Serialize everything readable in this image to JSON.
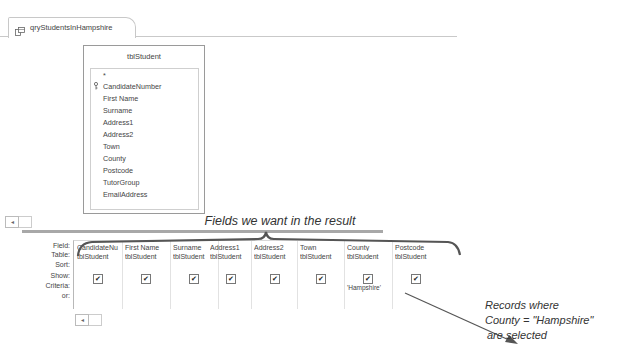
{
  "tab": {
    "label": "qryStudentsInHampshire",
    "icon": "query-icon"
  },
  "table": {
    "name": "tblStudent",
    "fields": [
      "*",
      "CandidateNumber",
      "First Name",
      "Surname",
      "Address1",
      "Address2",
      "Town",
      "County",
      "Postcode",
      "TutorGroup",
      "EmailAddress"
    ],
    "primary_key": "CandidateNumber"
  },
  "grid": {
    "row_labels": {
      "field": "Field:",
      "table": "Table:",
      "sort": "Sort:",
      "show": "Show:",
      "criteria": "Criteria:",
      "or": "or:"
    },
    "columns": [
      {
        "field": "CandidateNumber",
        "display": "CandidateNu",
        "table": "tblStudent",
        "show": true,
        "criteria": ""
      },
      {
        "field": "First Name",
        "display": "First Name",
        "table": "tblStudent",
        "show": true,
        "criteria": ""
      },
      {
        "field": "Surname",
        "display": "Surname",
        "table": "tblStudent",
        "show": true,
        "criteria": ""
      },
      {
        "field": "Address1",
        "display": "Address1",
        "table": "tblStudent",
        "show": true,
        "criteria": ""
      },
      {
        "field": "Address2",
        "display": "Address2",
        "table": "tblStudent",
        "show": true,
        "criteria": ""
      },
      {
        "field": "Town",
        "display": "Town",
        "table": "tblStudent",
        "show": true,
        "criteria": ""
      },
      {
        "field": "County",
        "display": "County",
        "table": "tblStudent",
        "show": true,
        "criteria": "'Hampshire'"
      },
      {
        "field": "Postcode",
        "display": "Postcode",
        "table": "tblStudent",
        "show": true,
        "criteria": ""
      }
    ],
    "checkmark": "✔"
  },
  "annotations": {
    "fields_note": "Fields we want in the result",
    "callout_line1": "Records where",
    "callout_line2": "County = \"Hampshire\"",
    "callout_line3": "are selected"
  },
  "scroll": {
    "left_arrow": "◂"
  }
}
